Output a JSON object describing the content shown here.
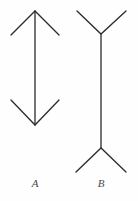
{
  "figure": {
    "background_color": "#fefefe",
    "stroke_color": "#2b2b2b",
    "label_color": "#4a4a4a",
    "stroke_width": 1.3,
    "width": 138,
    "height": 201
  },
  "shapes": {
    "figure_a": {
      "name": "arrowheads-inward-figure",
      "label": "A",
      "shaft": {
        "x": 35,
        "y1": 11,
        "y2": 125
      },
      "top_arrowhead": {
        "vertex": [
          35,
          11
        ],
        "left_tip": [
          11,
          35
        ],
        "right_tip": [
          59,
          35
        ],
        "direction": "opens-downward"
      },
      "bottom_arrowhead": {
        "vertex": [
          35,
          125
        ],
        "left_tip": [
          11,
          100
        ],
        "right_tip": [
          59,
          100
        ],
        "direction": "opens-upward"
      }
    },
    "figure_b": {
      "name": "fins-outward-figure",
      "label": "B",
      "shaft": {
        "x": 101,
        "y1": 34,
        "y2": 148
      },
      "top_fins": {
        "vertex": [
          101,
          34
        ],
        "left_tip": [
          77,
          11
        ],
        "right_tip": [
          126,
          11
        ],
        "direction": "opens-upward"
      },
      "bottom_fins": {
        "vertex": [
          101,
          148
        ],
        "left_tip": [
          76,
          172
        ],
        "right_tip": [
          126,
          172
        ],
        "direction": "opens-downward"
      }
    }
  },
  "labels": {
    "a": "A",
    "b": "B"
  }
}
